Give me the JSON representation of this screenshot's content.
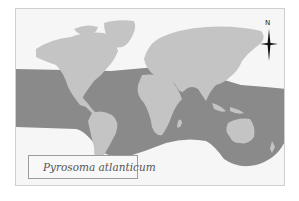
{
  "map": {
    "legend": {
      "label": "Pyrosoma atlanticum",
      "swatch_color": "#8a8a8a"
    },
    "compass": {
      "north_label": "N"
    },
    "colors": {
      "land": "#c4c4c4",
      "distribution": "#8a8a8a",
      "unoccupied_ocean": "#f6f6f6",
      "frame_border": "#cfcfcf"
    }
  }
}
